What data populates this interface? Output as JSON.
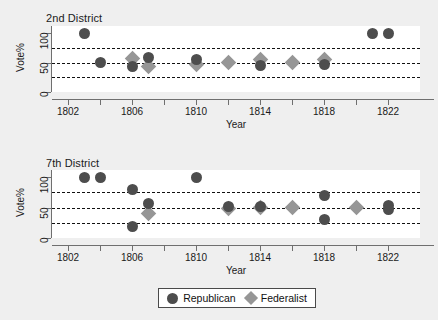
{
  "figure": {
    "background_color": "#efefef",
    "plot_background_color": "#ffffff",
    "axis_title_x": "Year",
    "axis_title_y": "Vote%"
  },
  "legend": {
    "items": [
      {
        "label": "Republican",
        "marker": "circle",
        "color": "#4d4d4d"
      },
      {
        "label": "Federalist",
        "marker": "diamond",
        "color": "#969696"
      }
    ]
  },
  "chart_data": [
    {
      "type": "scatter",
      "title": "2nd District",
      "xlabel": "Year",
      "ylabel": "Vote%",
      "xlim": [
        1801,
        1824
      ],
      "ylim": [
        0,
        112
      ],
      "yticks": [
        0,
        50,
        100
      ],
      "xticks": [
        1802,
        1804,
        1806,
        1808,
        1810,
        1812,
        1814,
        1816,
        1818,
        1820,
        1822
      ],
      "xticklabels": [
        "1802",
        "",
        "1806",
        "",
        "1810",
        "",
        "1814",
        "",
        "1818",
        "",
        "1822"
      ],
      "grid": false,
      "reference_lines": [
        25,
        50,
        75
      ],
      "reference_line_style": "dashed",
      "legend_position": "below-figure",
      "series": [
        {
          "name": "Republican",
          "marker": "circle",
          "color": "#4d4d4d",
          "points": [
            {
              "x": 1803,
              "y": 100
            },
            {
              "x": 1804,
              "y": 50
            },
            {
              "x": 1806,
              "y": 44
            },
            {
              "x": 1807,
              "y": 58
            },
            {
              "x": 1810,
              "y": 55
            },
            {
              "x": 1814,
              "y": 45
            },
            {
              "x": 1818,
              "y": 46
            },
            {
              "x": 1821,
              "y": 100
            },
            {
              "x": 1822,
              "y": 100
            }
          ]
        },
        {
          "name": "Federalist",
          "marker": "diamond",
          "color": "#969696",
          "points": [
            {
              "x": 1806,
              "y": 57
            },
            {
              "x": 1807,
              "y": 43
            },
            {
              "x": 1810,
              "y": 46
            },
            {
              "x": 1812,
              "y": 50
            },
            {
              "x": 1814,
              "y": 56
            },
            {
              "x": 1816,
              "y": 50
            },
            {
              "x": 1818,
              "y": 55
            }
          ]
        }
      ]
    },
    {
      "type": "scatter",
      "title": "7th District",
      "xlabel": "Year",
      "ylabel": "Vote%",
      "xlim": [
        1801,
        1824
      ],
      "ylim": [
        0,
        112
      ],
      "yticks": [
        0,
        50,
        100
      ],
      "xticks": [
        1802,
        1804,
        1806,
        1808,
        1810,
        1812,
        1814,
        1816,
        1818,
        1820,
        1822
      ],
      "xticklabels": [
        "1802",
        "",
        "1806",
        "",
        "1810",
        "",
        "1814",
        "",
        "1818",
        "",
        "1822"
      ],
      "grid": false,
      "reference_lines": [
        25,
        50,
        75
      ],
      "reference_line_style": "dashed",
      "legend_position": "below-figure",
      "series": [
        {
          "name": "Republican",
          "marker": "circle",
          "color": "#4d4d4d",
          "points": [
            {
              "x": 1803,
              "y": 100
            },
            {
              "x": 1804,
              "y": 100
            },
            {
              "x": 1806,
              "y": 80
            },
            {
              "x": 1806,
              "y": 19
            },
            {
              "x": 1807,
              "y": 57
            },
            {
              "x": 1810,
              "y": 100
            },
            {
              "x": 1812,
              "y": 52
            },
            {
              "x": 1814,
              "y": 52
            },
            {
              "x": 1818,
              "y": 70
            },
            {
              "x": 1818,
              "y": 31
            },
            {
              "x": 1822,
              "y": 54
            },
            {
              "x": 1822,
              "y": 47
            }
          ]
        },
        {
          "name": "Federalist",
          "marker": "diamond",
          "color": "#969696",
          "points": [
            {
              "x": 1807,
              "y": 41
            },
            {
              "x": 1812,
              "y": 48
            },
            {
              "x": 1814,
              "y": 50
            },
            {
              "x": 1816,
              "y": 50
            },
            {
              "x": 1820,
              "y": 50
            }
          ]
        }
      ]
    }
  ]
}
